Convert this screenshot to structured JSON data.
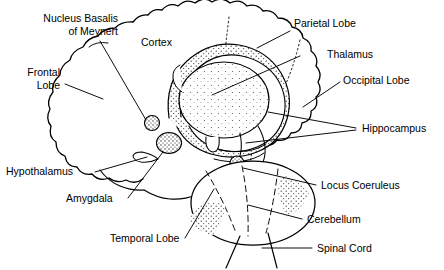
{
  "figure": {
    "ink_color": "#000000",
    "background_color": "#ffffff"
  },
  "labels": {
    "nucleus_basalis": "Nucleus Basalis\nof Meynert",
    "cortex": "Cortex",
    "frontal_lobe": "Frontal\nLobe",
    "parietal_lobe": "Parietal Lobe",
    "thalamus": "Thalamus",
    "occipital_lobe": "Occipital Lobe",
    "hippocampus": "Hippocampus",
    "hypothalamus": "Hypothalamus",
    "amygdala": "Amygdala",
    "temporal_lobe": "Temporal Lobe",
    "locus_coeruleus": "Locus Coeruleus",
    "cerebellum": "Cerebellum",
    "spinal_cord": "Spinal Cord"
  }
}
